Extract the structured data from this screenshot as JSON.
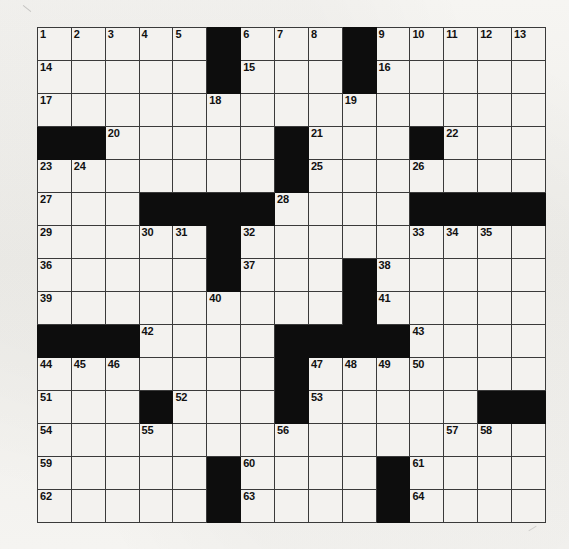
{
  "puzzle": {
    "title": "Crossword Puzzle Grid",
    "rows": 15,
    "cols": 15,
    "colors": {
      "paper": "#f4f3f0",
      "cell": "#f3f2ef",
      "block": "#0d0d0d",
      "gridline": "#3a3a3a",
      "number": "#111111"
    },
    "grid": [
      [
        {
          "block": false,
          "num": "1"
        },
        {
          "block": false,
          "num": "2"
        },
        {
          "block": false,
          "num": "3"
        },
        {
          "block": false,
          "num": "4"
        },
        {
          "block": false,
          "num": "5"
        },
        {
          "block": true,
          "num": ""
        },
        {
          "block": false,
          "num": "6"
        },
        {
          "block": false,
          "num": "7"
        },
        {
          "block": false,
          "num": "8"
        },
        {
          "block": true,
          "num": ""
        },
        {
          "block": false,
          "num": "9"
        },
        {
          "block": false,
          "num": "10"
        },
        {
          "block": false,
          "num": "11"
        },
        {
          "block": false,
          "num": "12"
        },
        {
          "block": false,
          "num": "13"
        }
      ],
      [
        {
          "block": false,
          "num": "14"
        },
        {
          "block": false,
          "num": ""
        },
        {
          "block": false,
          "num": ""
        },
        {
          "block": false,
          "num": ""
        },
        {
          "block": false,
          "num": ""
        },
        {
          "block": true,
          "num": ""
        },
        {
          "block": false,
          "num": "15"
        },
        {
          "block": false,
          "num": ""
        },
        {
          "block": false,
          "num": ""
        },
        {
          "block": true,
          "num": ""
        },
        {
          "block": false,
          "num": "16"
        },
        {
          "block": false,
          "num": ""
        },
        {
          "block": false,
          "num": ""
        },
        {
          "block": false,
          "num": ""
        },
        {
          "block": false,
          "num": ""
        }
      ],
      [
        {
          "block": false,
          "num": "17"
        },
        {
          "block": false,
          "num": ""
        },
        {
          "block": false,
          "num": ""
        },
        {
          "block": false,
          "num": ""
        },
        {
          "block": false,
          "num": ""
        },
        {
          "block": false,
          "num": "18"
        },
        {
          "block": false,
          "num": ""
        },
        {
          "block": false,
          "num": ""
        },
        {
          "block": false,
          "num": ""
        },
        {
          "block": false,
          "num": "19"
        },
        {
          "block": false,
          "num": ""
        },
        {
          "block": false,
          "num": ""
        },
        {
          "block": false,
          "num": ""
        },
        {
          "block": false,
          "num": ""
        },
        {
          "block": false,
          "num": ""
        }
      ],
      [
        {
          "block": true,
          "num": ""
        },
        {
          "block": true,
          "num": ""
        },
        {
          "block": false,
          "num": "20"
        },
        {
          "block": false,
          "num": ""
        },
        {
          "block": false,
          "num": ""
        },
        {
          "block": false,
          "num": ""
        },
        {
          "block": false,
          "num": ""
        },
        {
          "block": true,
          "num": ""
        },
        {
          "block": false,
          "num": "21"
        },
        {
          "block": false,
          "num": ""
        },
        {
          "block": false,
          "num": ""
        },
        {
          "block": true,
          "num": ""
        },
        {
          "block": false,
          "num": "22"
        },
        {
          "block": false,
          "num": ""
        },
        {
          "block": false,
          "num": ""
        }
      ],
      [
        {
          "block": false,
          "num": "23"
        },
        {
          "block": false,
          "num": "24"
        },
        {
          "block": false,
          "num": ""
        },
        {
          "block": false,
          "num": ""
        },
        {
          "block": false,
          "num": ""
        },
        {
          "block": false,
          "num": ""
        },
        {
          "block": false,
          "num": ""
        },
        {
          "block": true,
          "num": ""
        },
        {
          "block": false,
          "num": "25"
        },
        {
          "block": false,
          "num": ""
        },
        {
          "block": false,
          "num": ""
        },
        {
          "block": false,
          "num": "26"
        },
        {
          "block": false,
          "num": ""
        },
        {
          "block": false,
          "num": ""
        },
        {
          "block": false,
          "num": ""
        }
      ],
      [
        {
          "block": false,
          "num": "27"
        },
        {
          "block": false,
          "num": ""
        },
        {
          "block": false,
          "num": ""
        },
        {
          "block": true,
          "num": ""
        },
        {
          "block": true,
          "num": ""
        },
        {
          "block": true,
          "num": ""
        },
        {
          "block": true,
          "num": ""
        },
        {
          "block": false,
          "num": "28"
        },
        {
          "block": false,
          "num": ""
        },
        {
          "block": false,
          "num": ""
        },
        {
          "block": false,
          "num": ""
        },
        {
          "block": true,
          "num": ""
        },
        {
          "block": true,
          "num": ""
        },
        {
          "block": true,
          "num": ""
        },
        {
          "block": true,
          "num": ""
        }
      ],
      [
        {
          "block": false,
          "num": "29"
        },
        {
          "block": false,
          "num": ""
        },
        {
          "block": false,
          "num": ""
        },
        {
          "block": false,
          "num": "30"
        },
        {
          "block": false,
          "num": "31"
        },
        {
          "block": true,
          "num": ""
        },
        {
          "block": false,
          "num": "32"
        },
        {
          "block": false,
          "num": ""
        },
        {
          "block": false,
          "num": ""
        },
        {
          "block": false,
          "num": ""
        },
        {
          "block": false,
          "num": ""
        },
        {
          "block": false,
          "num": "33"
        },
        {
          "block": false,
          "num": "34"
        },
        {
          "block": false,
          "num": "35"
        },
        {
          "block": false,
          "num": ""
        }
      ],
      [
        {
          "block": false,
          "num": "36"
        },
        {
          "block": false,
          "num": ""
        },
        {
          "block": false,
          "num": ""
        },
        {
          "block": false,
          "num": ""
        },
        {
          "block": false,
          "num": ""
        },
        {
          "block": true,
          "num": ""
        },
        {
          "block": false,
          "num": "37"
        },
        {
          "block": false,
          "num": ""
        },
        {
          "block": false,
          "num": ""
        },
        {
          "block": true,
          "num": ""
        },
        {
          "block": false,
          "num": "38"
        },
        {
          "block": false,
          "num": ""
        },
        {
          "block": false,
          "num": ""
        },
        {
          "block": false,
          "num": ""
        },
        {
          "block": false,
          "num": ""
        }
      ],
      [
        {
          "block": false,
          "num": "39"
        },
        {
          "block": false,
          "num": ""
        },
        {
          "block": false,
          "num": ""
        },
        {
          "block": false,
          "num": ""
        },
        {
          "block": false,
          "num": ""
        },
        {
          "block": false,
          "num": "40"
        },
        {
          "block": false,
          "num": ""
        },
        {
          "block": false,
          "num": ""
        },
        {
          "block": false,
          "num": ""
        },
        {
          "block": true,
          "num": ""
        },
        {
          "block": false,
          "num": "41"
        },
        {
          "block": false,
          "num": ""
        },
        {
          "block": false,
          "num": ""
        },
        {
          "block": false,
          "num": ""
        },
        {
          "block": false,
          "num": ""
        }
      ],
      [
        {
          "block": true,
          "num": ""
        },
        {
          "block": true,
          "num": ""
        },
        {
          "block": true,
          "num": ""
        },
        {
          "block": false,
          "num": "42"
        },
        {
          "block": false,
          "num": ""
        },
        {
          "block": false,
          "num": ""
        },
        {
          "block": false,
          "num": ""
        },
        {
          "block": true,
          "num": ""
        },
        {
          "block": true,
          "num": ""
        },
        {
          "block": true,
          "num": ""
        },
        {
          "block": true,
          "num": ""
        },
        {
          "block": false,
          "num": "43"
        },
        {
          "block": false,
          "num": ""
        },
        {
          "block": false,
          "num": ""
        },
        {
          "block": false,
          "num": ""
        }
      ],
      [
        {
          "block": false,
          "num": "44"
        },
        {
          "block": false,
          "num": "45"
        },
        {
          "block": false,
          "num": "46"
        },
        {
          "block": false,
          "num": ""
        },
        {
          "block": false,
          "num": ""
        },
        {
          "block": false,
          "num": ""
        },
        {
          "block": false,
          "num": ""
        },
        {
          "block": true,
          "num": ""
        },
        {
          "block": false,
          "num": "47"
        },
        {
          "block": false,
          "num": "48"
        },
        {
          "block": false,
          "num": "49"
        },
        {
          "block": false,
          "num": "50"
        },
        {
          "block": false,
          "num": ""
        },
        {
          "block": false,
          "num": ""
        },
        {
          "block": false,
          "num": ""
        }
      ],
      [
        {
          "block": false,
          "num": "51"
        },
        {
          "block": false,
          "num": ""
        },
        {
          "block": false,
          "num": ""
        },
        {
          "block": true,
          "num": ""
        },
        {
          "block": false,
          "num": "52"
        },
        {
          "block": false,
          "num": ""
        },
        {
          "block": false,
          "num": ""
        },
        {
          "block": true,
          "num": ""
        },
        {
          "block": false,
          "num": "53"
        },
        {
          "block": false,
          "num": ""
        },
        {
          "block": false,
          "num": ""
        },
        {
          "block": false,
          "num": ""
        },
        {
          "block": false,
          "num": ""
        },
        {
          "block": true,
          "num": ""
        },
        {
          "block": true,
          "num": ""
        }
      ],
      [
        {
          "block": false,
          "num": "54"
        },
        {
          "block": false,
          "num": ""
        },
        {
          "block": false,
          "num": ""
        },
        {
          "block": false,
          "num": "55"
        },
        {
          "block": false,
          "num": ""
        },
        {
          "block": false,
          "num": ""
        },
        {
          "block": false,
          "num": ""
        },
        {
          "block": false,
          "num": "56"
        },
        {
          "block": false,
          "num": ""
        },
        {
          "block": false,
          "num": ""
        },
        {
          "block": false,
          "num": ""
        },
        {
          "block": false,
          "num": ""
        },
        {
          "block": false,
          "num": "57"
        },
        {
          "block": false,
          "num": "58"
        },
        {
          "block": false,
          "num": ""
        }
      ],
      [
        {
          "block": false,
          "num": "59"
        },
        {
          "block": false,
          "num": ""
        },
        {
          "block": false,
          "num": ""
        },
        {
          "block": false,
          "num": ""
        },
        {
          "block": false,
          "num": ""
        },
        {
          "block": true,
          "num": ""
        },
        {
          "block": false,
          "num": "60"
        },
        {
          "block": false,
          "num": ""
        },
        {
          "block": false,
          "num": ""
        },
        {
          "block": false,
          "num": ""
        },
        {
          "block": true,
          "num": ""
        },
        {
          "block": false,
          "num": "61"
        },
        {
          "block": false,
          "num": ""
        },
        {
          "block": false,
          "num": ""
        },
        {
          "block": false,
          "num": ""
        }
      ],
      [
        {
          "block": false,
          "num": "62"
        },
        {
          "block": false,
          "num": ""
        },
        {
          "block": false,
          "num": ""
        },
        {
          "block": false,
          "num": ""
        },
        {
          "block": false,
          "num": ""
        },
        {
          "block": true,
          "num": ""
        },
        {
          "block": false,
          "num": "63"
        },
        {
          "block": false,
          "num": ""
        },
        {
          "block": false,
          "num": ""
        },
        {
          "block": false,
          "num": ""
        },
        {
          "block": true,
          "num": ""
        },
        {
          "block": false,
          "num": "64"
        },
        {
          "block": false,
          "num": ""
        },
        {
          "block": false,
          "num": ""
        },
        {
          "block": false,
          "num": ""
        }
      ]
    ]
  }
}
